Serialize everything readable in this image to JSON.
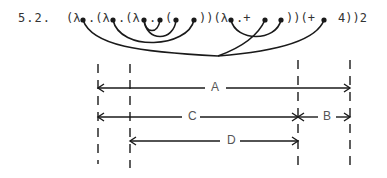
{
  "equation": {
    "number": "5.2.",
    "segments": [
      {
        "text": "(λ",
        "x": 66
      },
      {
        "text": ".(λ",
        "x": 88
      },
      {
        "text": ".(λ",
        "x": 118
      },
      {
        "text": ".",
        "x": 149
      },
      {
        "text": "(",
        "x": 165
      },
      {
        "text": "))(λ",
        "x": 199
      },
      {
        "text": ".+",
        "x": 236
      },
      {
        "text": "))(+",
        "x": 286
      },
      {
        "text": "4))2",
        "x": 338
      }
    ],
    "dots_x": [
      83,
      113,
      144,
      160,
      176,
      194,
      231,
      265,
      281,
      324
    ]
  },
  "intervals": {
    "A": {
      "label": "A",
      "from": 98,
      "to": 350,
      "y": 88
    },
    "C": {
      "label": "C",
      "from": 98,
      "to": 298,
      "y": 117
    },
    "B": {
      "label": "B",
      "from": 298,
      "to": 350,
      "y": 117
    },
    "D": {
      "label": "D",
      "from": 130,
      "to": 298,
      "y": 141
    }
  },
  "guides_x": [
    98,
    130,
    298,
    350
  ],
  "colors": {
    "ink": "#1a1a1a",
    "text": "#333333"
  }
}
